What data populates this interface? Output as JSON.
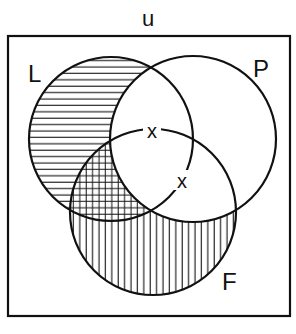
{
  "diagram": {
    "type": "venn",
    "universe_label": "u",
    "sets": [
      {
        "id": "L",
        "label": "L",
        "cx": 111,
        "cy": 139,
        "r": 82,
        "label_x": 28,
        "label_y": 80
      },
      {
        "id": "P",
        "label": "P",
        "cx": 193,
        "cy": 139,
        "r": 83,
        "label_x": 253,
        "label_y": 75
      },
      {
        "id": "F",
        "label": "F",
        "cx": 153,
        "cy": 212,
        "r": 83,
        "label_x": 222,
        "label_y": 289
      }
    ],
    "shading": [
      {
        "region": "L only",
        "pattern": "horizontal-lines"
      },
      {
        "region": "L and F not P",
        "pattern": "crosshatch"
      },
      {
        "region": "F only",
        "pattern": "vertical-lines"
      }
    ],
    "markers": [
      {
        "symbol": "x",
        "region": "L and P boundary near F",
        "x": 152,
        "y": 131
      },
      {
        "symbol": "x",
        "region": "P and F boundary near L",
        "x": 182,
        "y": 181
      }
    ],
    "colors": {
      "stroke": "#111111",
      "background": "#ffffff"
    }
  }
}
